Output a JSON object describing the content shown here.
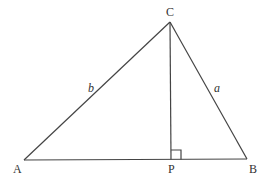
{
  "diagram": {
    "type": "triangle-with-altitude",
    "vertices": {
      "A": {
        "label": "A",
        "x": 24,
        "y": 160
      },
      "B": {
        "label": "B",
        "x": 247,
        "y": 159
      },
      "C": {
        "label": "C",
        "x": 170,
        "y": 22
      },
      "P": {
        "label": "P",
        "x": 171,
        "y": 159.5
      }
    },
    "side_labels": {
      "b": {
        "label": "b",
        "side": "AC"
      },
      "a": {
        "label": "a",
        "side": "BC"
      }
    },
    "right_angle_marker": {
      "at": "P",
      "size": 10
    },
    "colors": {
      "stroke": "#444444",
      "text": "#333333",
      "background": "#ffffff"
    }
  }
}
